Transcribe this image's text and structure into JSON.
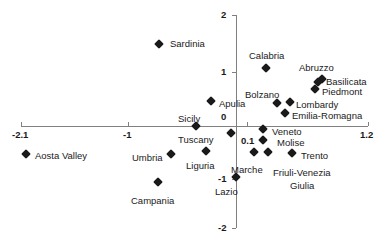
{
  "chart_data": {
    "type": "scatter",
    "title": "",
    "xlabel": "",
    "ylabel": "",
    "xlim": [
      -2.1,
      1.2
    ],
    "ylim": [
      -2,
      2
    ],
    "grid": false,
    "legend": "none",
    "x_ticks": [
      {
        "value": -2.1,
        "label": "-2.1"
      },
      {
        "value": -1,
        "label": "-1"
      },
      {
        "value": 0.1,
        "label": "0.1"
      },
      {
        "value": 1.2,
        "label": "1.2"
      }
    ],
    "y_ticks": [
      {
        "value": 2,
        "label": "2"
      },
      {
        "value": 1,
        "label": "1"
      },
      {
        "value": 0,
        "label": "0"
      },
      {
        "value": -1,
        "label": "-1"
      },
      {
        "value": -2,
        "label": "-2"
      }
    ],
    "points": [
      {
        "label": "Sardinia",
        "x": -0.71,
        "y": 1.54
      },
      {
        "label": "Calabria",
        "x": 0.28,
        "y": 1.09
      },
      {
        "label": "Abruzzo",
        "x": 0.76,
        "y": 0.82
      },
      {
        "label": "Basilicata",
        "x": 0.8,
        "y": 0.85
      },
      {
        "label": "Piedmont",
        "x": 0.73,
        "y": 0.71
      },
      {
        "label": "Bolzano",
        "x": 0.38,
        "y": 0.43
      },
      {
        "label": "Lombardy",
        "x": 0.5,
        "y": 0.45
      },
      {
        "label": "Emilia-Romagna",
        "x": 0.45,
        "y": 0.24
      },
      {
        "label": "Apulia",
        "x": -0.23,
        "y": 0.47
      },
      {
        "label": "Sicily",
        "x": -0.37,
        "y": 0.0
      },
      {
        "label": "Tuscany",
        "x": -0.05,
        "y": -0.13
      },
      {
        "label": "Veneto",
        "x": 0.25,
        "y": -0.06
      },
      {
        "label": "Molise",
        "x": 0.25,
        "y": -0.26
      },
      {
        "label": "Aosta Valley",
        "x": -1.94,
        "y": -0.53
      },
      {
        "label": "Umbria",
        "x": -0.6,
        "y": -0.53
      },
      {
        "label": "Liguria",
        "x": -0.28,
        "y": -0.47
      },
      {
        "label": "Marche",
        "x": 0.17,
        "y": -0.49
      },
      {
        "label": "Friuli-Venezia Giulia",
        "x": 0.3,
        "y": -0.49
      },
      {
        "label": "Trento",
        "x": 0.52,
        "y": -0.51
      },
      {
        "label": "Lazio",
        "x": 0.0,
        "y": -0.98
      },
      {
        "label": "Campania",
        "x": -0.72,
        "y": -1.05
      }
    ]
  },
  "plot": {
    "marker_color": "#1a1a1a",
    "axis_color": "#808080",
    "markers": [
      {
        "name": "marker-sardinia",
        "left": 159,
        "top": 44
      },
      {
        "name": "marker-calabria",
        "left": 266,
        "top": 68
      },
      {
        "name": "marker-basilicata",
        "left": 322,
        "top": 79
      },
      {
        "name": "marker-abruzzo",
        "left": 318,
        "top": 82
      },
      {
        "name": "marker-piedmont",
        "left": 315,
        "top": 89
      },
      {
        "name": "marker-bolzano",
        "left": 277,
        "top": 103
      },
      {
        "name": "marker-lombardy",
        "left": 290,
        "top": 102
      },
      {
        "name": "marker-emilia-romagna",
        "left": 285,
        "top": 113
      },
      {
        "name": "marker-apulia",
        "left": 211,
        "top": 101
      },
      {
        "name": "marker-sicily",
        "left": 196,
        "top": 126
      },
      {
        "name": "marker-tuscany",
        "left": 231,
        "top": 133
      },
      {
        "name": "marker-veneto",
        "left": 263,
        "top": 129
      },
      {
        "name": "marker-molise",
        "left": 263,
        "top": 140
      },
      {
        "name": "marker-aosta-valley",
        "left": 26,
        "top": 154
      },
      {
        "name": "marker-umbria",
        "left": 171,
        "top": 154
      },
      {
        "name": "marker-liguria",
        "left": 206,
        "top": 151
      },
      {
        "name": "marker-marche",
        "left": 254,
        "top": 152
      },
      {
        "name": "marker-friuli-venezia-giulia",
        "left": 268,
        "top": 152
      },
      {
        "name": "marker-trento",
        "left": 292,
        "top": 153
      },
      {
        "name": "marker-lazio",
        "left": 236,
        "top": 177
      },
      {
        "name": "marker-campania",
        "left": 158,
        "top": 182
      }
    ],
    "labels": [
      {
        "name": "label-sardinia",
        "text": "Sardinia",
        "left": 170,
        "top": 38
      },
      {
        "name": "label-calabria",
        "text": "Calabria",
        "left": 249,
        "top": 50
      },
      {
        "name": "label-abruzzo",
        "text": "Abruzzo",
        "left": 299,
        "top": 62
      },
      {
        "name": "label-basilicata",
        "text": "Basilicata",
        "left": 326,
        "top": 76
      },
      {
        "name": "label-piedmont",
        "text": "Piedmont",
        "left": 322,
        "top": 86
      },
      {
        "name": "label-bolzano",
        "text": "Bolzano",
        "left": 245,
        "top": 89
      },
      {
        "name": "label-lombardy",
        "text": "Lombardy",
        "left": 296,
        "top": 99
      },
      {
        "name": "label-emilia-romagna",
        "text": "Emilia-Romagna",
        "left": 292,
        "top": 110
      },
      {
        "name": "label-apulia",
        "text": "Apulia",
        "left": 219,
        "top": 98
      },
      {
        "name": "label-sicily",
        "text": "Sicily",
        "left": 178,
        "top": 113
      },
      {
        "name": "label-tuscany",
        "text": "Tuscany",
        "left": 178,
        "top": 134
      },
      {
        "name": "label-veneto",
        "text": "Veneto",
        "left": 272,
        "top": 126
      },
      {
        "name": "label-molise",
        "text": "Molise",
        "left": 277,
        "top": 137
      },
      {
        "name": "label-aosta-valley",
        "text": "Aosta Valley",
        "left": 35,
        "top": 150
      },
      {
        "name": "label-umbria",
        "text": "Umbria",
        "left": 132,
        "top": 152
      },
      {
        "name": "label-liguria",
        "text": "Liguria",
        "left": 186,
        "top": 160
      },
      {
        "name": "label-marche",
        "text": "Marche",
        "left": 231,
        "top": 164
      },
      {
        "name": "label-friuli-venezia",
        "text": "Friuli-Venezia",
        "left": 273,
        "top": 167
      },
      {
        "name": "label-giulia",
        "text": "Giulia",
        "left": 290,
        "top": 180
      },
      {
        "name": "label-trento",
        "text": "Trento",
        "left": 301,
        "top": 150
      },
      {
        "name": "label-lazio",
        "text": "Lazio",
        "left": 215,
        "top": 186
      },
      {
        "name": "label-campania",
        "text": "Campania",
        "left": 131,
        "top": 195
      }
    ]
  }
}
